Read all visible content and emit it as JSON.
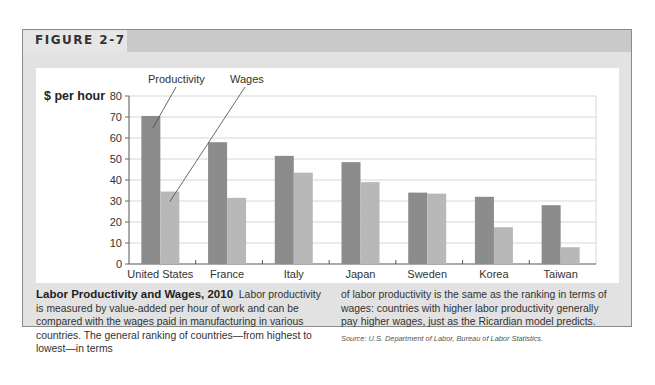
{
  "figure": {
    "label": "FIGURE 2-7"
  },
  "caption": {
    "title": "Labor Productivity and Wages, 2010",
    "body_left": "Labor productivity is measured by value-added per hour of work and can be compared with the wages paid in manufacturing in various countries. The general ranking of countries—from highest to lowest—in terms",
    "body_right": "of labor productivity is the same as the ranking in terms of wages: countries with higher labor productivity generally pay higher wages, just as the Ricardian model predicts.",
    "source": "Source: U.S. Department of Labor, Bureau of Labor Statistics."
  },
  "colors": {
    "productivity": "#8c8c8c",
    "wages": "#b8b8b8",
    "grid": "#d6d6d6",
    "frame": "#e2e2e2",
    "header_bar": "#c9c9c9"
  },
  "chart_data": {
    "type": "bar",
    "title": "",
    "xlabel": "",
    "ylabel": "$ per hour",
    "ylim": [
      0,
      80
    ],
    "yticks": [
      0,
      10,
      20,
      30,
      40,
      50,
      60,
      70,
      80
    ],
    "grid": true,
    "legend_position": "annotations above first group",
    "annotations": [
      "Productivity",
      "Wages"
    ],
    "categories": [
      "United States",
      "France",
      "Italy",
      "Japan",
      "Sweden",
      "Korea",
      "Taiwan"
    ],
    "series": [
      {
        "name": "Productivity",
        "values": [
          70.5,
          58,
          51.5,
          48.5,
          34,
          32,
          28
        ]
      },
      {
        "name": "Wages",
        "values": [
          34.5,
          31.5,
          43.5,
          39,
          33.5,
          17.5,
          8
        ]
      }
    ]
  }
}
